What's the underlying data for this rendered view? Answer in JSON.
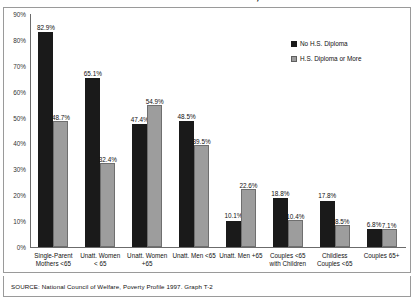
{
  "chart_data": {
    "type": "bar",
    "title": "and Level of Education, 1997",
    "xlabel": "",
    "ylabel": "",
    "ylim": [
      0,
      90
    ],
    "ytick_labels": [
      "0%",
      "10%",
      "20%",
      "30%",
      "40%",
      "50%",
      "60%",
      "70%",
      "80%",
      "90%"
    ],
    "ytick_values": [
      0,
      10,
      20,
      30,
      40,
      50,
      60,
      70,
      80,
      90
    ],
    "grid": false,
    "legend_position": "right",
    "categories": [
      "Single-Parent\nMothers <65",
      "Unatt. Women\n< 65",
      "Unatt. Women\n+65",
      "Unatt. Men <65",
      "Unatt. Men +65",
      "Couples <65\nwith Children",
      "Childless\nCouples <65",
      "Couples 65+"
    ],
    "series": [
      {
        "name": "No H.S. Diploma",
        "color": "#1a1a1a",
        "values": [
          82.9,
          65.1,
          47.4,
          48.5,
          10.1,
          18.8,
          17.8,
          6.8
        ],
        "labels": [
          "82.9%",
          "65.1%",
          "47.4%",
          "48.5%",
          "10.1%",
          "18.8%",
          "17.8%",
          "6.8%"
        ]
      },
      {
        "name": "H.S. Diploma or More",
        "color": "#9d9d9d",
        "values": [
          48.7,
          32.4,
          54.9,
          39.5,
          22.6,
          10.4,
          8.5,
          7.1
        ],
        "labels": [
          "48.7%",
          "32.4%",
          "54.9%",
          "39.5%",
          "22.6%",
          "10.4%",
          "8.5%",
          "7.1%"
        ]
      }
    ],
    "source": "SOURCE: National Council of Welfare, Poverty Profile 1997. Graph T-2"
  },
  "category_lines": [
    [
      "Single-Parent",
      "Mothers <65"
    ],
    [
      "Unatt. Women",
      "< 65"
    ],
    [
      "Unatt. Women",
      "+65"
    ],
    [
      "Unatt. Men <65",
      ""
    ],
    [
      "Unatt. Men +65",
      ""
    ],
    [
      "Couples <65",
      "with Children"
    ],
    [
      "Childless",
      "Couples <65"
    ],
    [
      "Couples 65+",
      ""
    ]
  ]
}
